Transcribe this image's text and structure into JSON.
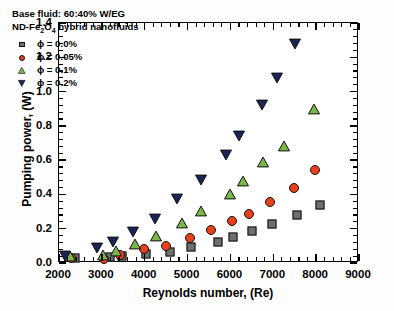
{
  "chart_data": {
    "type": "scatter",
    "title": "",
    "xlabel": "Reynolds number, (Re)",
    "ylabel": "Pumping power, (W)",
    "xlim": [
      2000,
      9000
    ],
    "ylim": [
      0.0,
      1.4
    ],
    "xticks": [
      2000,
      3000,
      4000,
      5000,
      6000,
      7000,
      8000,
      9000
    ],
    "yticks": [
      "0.0",
      "0.2",
      "0.4",
      "0.6",
      "0.8",
      "1.0",
      "1.2",
      "1.4"
    ],
    "xtick_labels": [
      "2000",
      "3000",
      "4000",
      "5000",
      "6000",
      "7000",
      "8000",
      "9000"
    ],
    "ytick_labels": [
      "0.0",
      "0.2",
      "0.4",
      "0.6",
      "0.8",
      "1.0",
      "1.2",
      "1.4"
    ],
    "grid": false,
    "minor_ticks": true,
    "legend_position": "upper-left",
    "annotations": [
      "Base fluid: 60:40% W/EG",
      "ND-Fe2O4 hybrid nanofluids"
    ],
    "series": [
      {
        "name": "phi = 0.0%",
        "label": "ϕ = 0.0%",
        "marker": "square",
        "color": "#6f6f6f",
        "edge_color": "#111111",
        "points": [
          {
            "x": 2370,
            "y": 0.03
          },
          {
            "x": 3200,
            "y": 0.035
          },
          {
            "x": 3470,
            "y": 0.04
          },
          {
            "x": 4020,
            "y": 0.05
          },
          {
            "x": 4600,
            "y": 0.065
          },
          {
            "x": 5080,
            "y": 0.095
          },
          {
            "x": 5700,
            "y": 0.125
          },
          {
            "x": 6050,
            "y": 0.15
          },
          {
            "x": 6500,
            "y": 0.185
          },
          {
            "x": 6980,
            "y": 0.23
          },
          {
            "x": 7550,
            "y": 0.28
          },
          {
            "x": 8080,
            "y": 0.34
          }
        ]
      },
      {
        "name": "phi = 0.05%",
        "label": "ϕ = 0.05%",
        "marker": "circle",
        "color": "#e8401a",
        "edge_color": "#111111",
        "points": [
          {
            "x": 2270,
            "y": 0.03
          },
          {
            "x": 3050,
            "y": 0.025
          },
          {
            "x": 3430,
            "y": 0.048
          },
          {
            "x": 3990,
            "y": 0.08
          },
          {
            "x": 4500,
            "y": 0.1
          },
          {
            "x": 5060,
            "y": 0.145
          },
          {
            "x": 5550,
            "y": 0.195
          },
          {
            "x": 6030,
            "y": 0.247
          },
          {
            "x": 6430,
            "y": 0.285
          },
          {
            "x": 6930,
            "y": 0.358
          },
          {
            "x": 7480,
            "y": 0.438
          },
          {
            "x": 7980,
            "y": 0.542
          }
        ]
      },
      {
        "name": "phi = 0.1%",
        "label": "ϕ = 0.1%",
        "marker": "triangle-up",
        "color": "#7ab648",
        "edge_color": "#111111",
        "points": [
          {
            "x": 2250,
            "y": 0.04
          },
          {
            "x": 3030,
            "y": 0.048
          },
          {
            "x": 3330,
            "y": 0.068
          },
          {
            "x": 3780,
            "y": 0.108
          },
          {
            "x": 4260,
            "y": 0.16
          },
          {
            "x": 4880,
            "y": 0.232
          },
          {
            "x": 5320,
            "y": 0.303
          },
          {
            "x": 5980,
            "y": 0.402
          },
          {
            "x": 6300,
            "y": 0.477
          },
          {
            "x": 6760,
            "y": 0.588
          },
          {
            "x": 7260,
            "y": 0.682
          },
          {
            "x": 7950,
            "y": 0.898
          }
        ]
      },
      {
        "name": "phi = 0.2%",
        "label": "ϕ = 0.2%",
        "marker": "triangle-down",
        "color": "#1a2456",
        "edge_color": "#111111",
        "points": [
          {
            "x": 2130,
            "y": 0.043
          },
          {
            "x": 2890,
            "y": 0.087
          },
          {
            "x": 3250,
            "y": 0.123
          },
          {
            "x": 3730,
            "y": 0.18
          },
          {
            "x": 4230,
            "y": 0.258
          },
          {
            "x": 4760,
            "y": 0.373
          },
          {
            "x": 5320,
            "y": 0.487
          },
          {
            "x": 5890,
            "y": 0.632
          },
          {
            "x": 6200,
            "y": 0.743
          },
          {
            "x": 6740,
            "y": 0.92
          },
          {
            "x": 7080,
            "y": 1.08
          },
          {
            "x": 7500,
            "y": 1.277
          }
        ]
      }
    ]
  }
}
